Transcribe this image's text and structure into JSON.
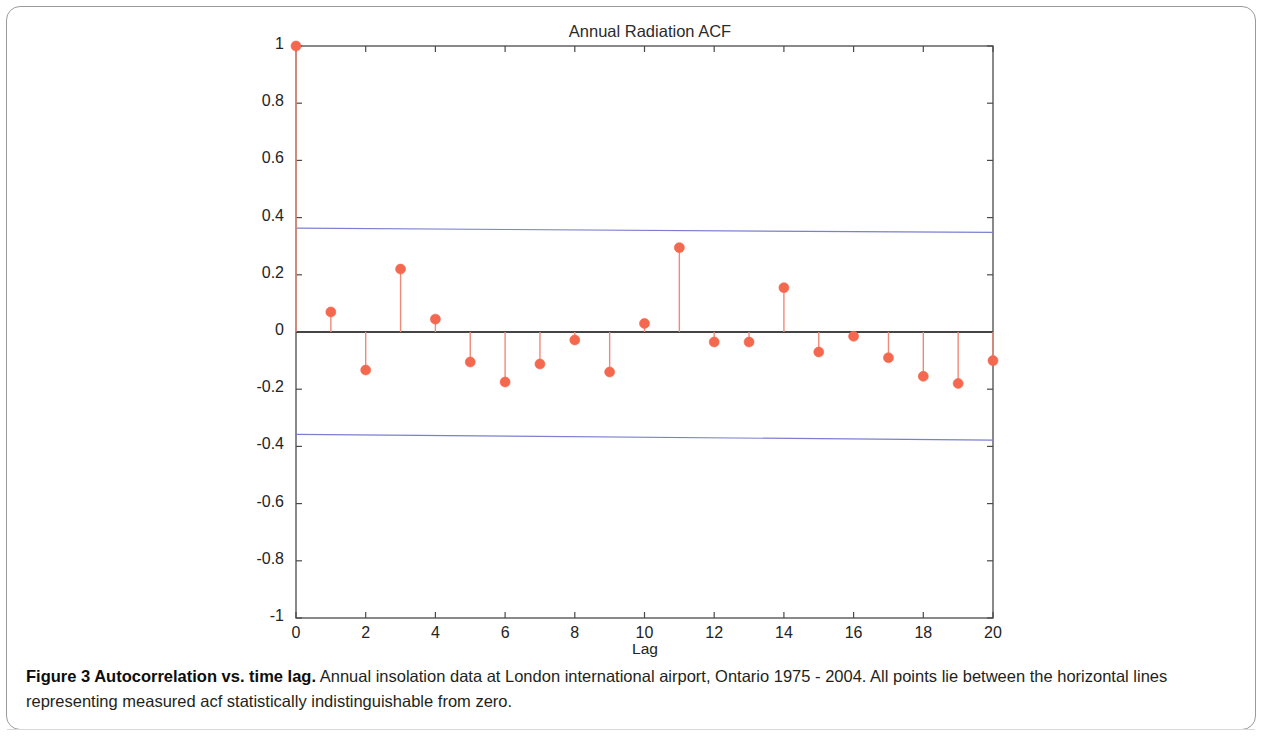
{
  "figure": {
    "caption_bold": "Figure 3 Autocorrelation vs. time lag.",
    "caption_rest": " Annual insolation data at London international airport, Ontario 1975 - 2004. All points lie between the horizontal lines representing measured acf statistically indistinguishable from zero."
  },
  "chart_data": {
    "type": "scatter",
    "title": "Annual Radiation ACF",
    "xlabel": "Lag",
    "ylabel": "",
    "xlim": [
      0,
      20
    ],
    "ylim": [
      -1,
      1
    ],
    "xticks": [
      0,
      2,
      4,
      6,
      8,
      10,
      12,
      14,
      16,
      18,
      20
    ],
    "xtick_labels": [
      "0",
      "2",
      "4",
      "6",
      "8",
      "10",
      "12",
      "14",
      "16",
      "18",
      "20"
    ],
    "yticks": [
      -1,
      -0.8,
      -0.6,
      -0.4,
      -0.2,
      0,
      0.2,
      0.4,
      0.6,
      0.8,
      1
    ],
    "ytick_labels": [
      "-1",
      "-0.8",
      "-0.6",
      "-0.4",
      "-0.2",
      "0",
      "0.2",
      "0.4",
      "0.6",
      "0.8",
      "1"
    ],
    "grid": false,
    "legend": null,
    "marker_color": "#f4684f",
    "stem_color": "#f08a78",
    "zero_line_color": "#444444",
    "confidence_line_color": "#7b7fd0",
    "x": [
      0,
      1,
      2,
      3,
      4,
      5,
      6,
      7,
      8,
      9,
      10,
      11,
      12,
      13,
      14,
      15,
      16,
      17,
      18,
      19,
      20
    ],
    "values": [
      1.0,
      0.07,
      -0.133,
      0.22,
      0.045,
      -0.105,
      -0.175,
      -0.112,
      -0.028,
      -0.14,
      0.03,
      0.295,
      -0.035,
      -0.035,
      0.155,
      -0.07,
      -0.015,
      -0.09,
      -0.155,
      -0.18,
      -0.1
    ],
    "confidence_upper": {
      "x": [
        0,
        20
      ],
      "y": [
        0.363,
        0.348
      ]
    },
    "confidence_lower": {
      "x": [
        0,
        20
      ],
      "y": [
        -0.358,
        -0.378
      ]
    },
    "series": [
      {
        "name": "ACF",
        "type": "stem",
        "x": [
          0,
          1,
          2,
          3,
          4,
          5,
          6,
          7,
          8,
          9,
          10,
          11,
          12,
          13,
          14,
          15,
          16,
          17,
          18,
          19,
          20
        ],
        "values": [
          1.0,
          0.07,
          -0.133,
          0.22,
          0.045,
          -0.105,
          -0.175,
          -0.112,
          -0.028,
          -0.14,
          0.03,
          0.295,
          -0.035,
          -0.035,
          0.155,
          -0.07,
          -0.015,
          -0.09,
          -0.155,
          -0.18,
          -0.1
        ]
      }
    ]
  }
}
